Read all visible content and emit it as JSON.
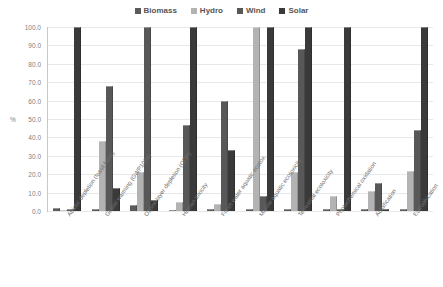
{
  "chart_data": {
    "type": "bar",
    "title": "",
    "subtitle": "",
    "xlabel": "",
    "ylabel": "%",
    "ylim": [
      0,
      100
    ],
    "grid": true,
    "legend_position": "top-center",
    "categories": [
      "Abiotic depletion (fossil fuels)",
      "Global warming (GWP100a)",
      "Ozone layer depletion (ODP)",
      "Human toxicity",
      "Fresh water aquatic ecotox.",
      "Marine aquatic ecotoxicity",
      "Terrestrial ecotoxicity",
      "Photochemical oxidation",
      "Acidification",
      "Eutrophication"
    ],
    "ytick_labels": [
      "100.0",
      "90.0",
      "80.0",
      "70.0",
      "60.0",
      "50.0",
      "40.0",
      "30.0",
      "20.0",
      "10.0",
      "0.0"
    ],
    "ytick_values": [
      100,
      90,
      80,
      70,
      60,
      50,
      40,
      30,
      20,
      10,
      0
    ],
    "series": [
      {
        "name": "Biomass",
        "color": "#5b5b5b",
        "values": [
          1.5,
          1.0,
          3.0,
          0.8,
          1.2,
          1.0,
          1.0,
          1.0,
          1.0,
          1.2
        ]
      },
      {
        "name": "Hydro",
        "color": "#b3b3b3",
        "values": [
          0.5,
          38.0,
          21.0,
          5.0,
          4.0,
          100.0,
          21.0,
          8.0,
          11.0,
          22.0
        ]
      },
      {
        "name": "Wind",
        "color": "#585858",
        "values": [
          1.0,
          68.0,
          100.0,
          47.0,
          60.0,
          8.0,
          88.0,
          1.0,
          15.0,
          44.0
        ]
      },
      {
        "name": "Solar",
        "color": "#3a3a3a",
        "values": [
          100.0,
          12.5,
          6.0,
          100.0,
          33.0,
          100.0,
          100.0,
          100.0,
          1.0,
          100.0
        ]
      }
    ]
  },
  "legend": {
    "entries": [
      {
        "label": "Biomass",
        "color": "#5b5b5b",
        "swatch_name": "legend-swatch-biomass"
      },
      {
        "label": "Hydro",
        "color": "#b3b3b3",
        "swatch_name": "legend-swatch-hydro"
      },
      {
        "label": "Wind",
        "color": "#585858",
        "swatch_name": "legend-swatch-wind"
      },
      {
        "label": "Solar",
        "color": "#3a3a3a",
        "swatch_name": "legend-swatch-solar"
      }
    ]
  },
  "axes": {
    "y_title": "%"
  }
}
